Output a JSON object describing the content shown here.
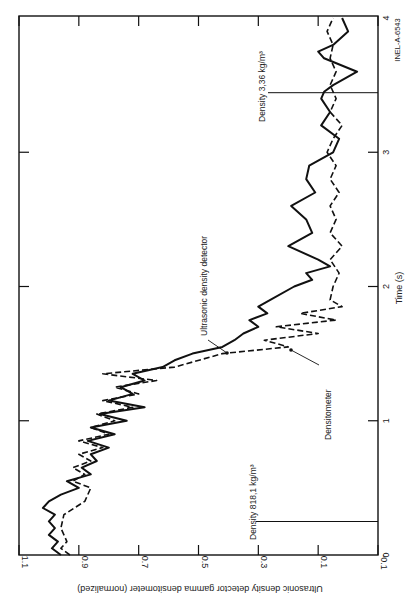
{
  "chart_data": {
    "type": "line",
    "orientation": "rotated 90 degrees clockwise (time axis vertical on right, value axis along bottom reading upside-down)",
    "title": "",
    "xlabel": "Time (s)",
    "ylabel": "Ultrasonic density detector gamma densitometer (normalized)",
    "xlim": [
      0,
      4
    ],
    "ylim": [
      -0.1,
      1.1
    ],
    "x_ticks": [
      "0",
      "1",
      "2",
      "3",
      "4"
    ],
    "y_ticks": [
      "1.1",
      "0.9",
      "0.7",
      "0.5",
      "0.3",
      "0.1",
      "-0.1"
    ],
    "grid": false,
    "legend": "inline annotations with leader arrows",
    "series": [
      {
        "name": "Ultrasonic density detector",
        "style": "solid",
        "points": [
          [
            0.0,
            0.96
          ],
          [
            0.05,
            0.99
          ],
          [
            0.1,
            0.97
          ],
          [
            0.15,
            1.0
          ],
          [
            0.2,
            0.98
          ],
          [
            0.25,
            1.0
          ],
          [
            0.3,
            0.98
          ],
          [
            0.35,
            1.02
          ],
          [
            0.4,
            1.0
          ],
          [
            0.45,
            0.96
          ],
          [
            0.5,
            0.9
          ],
          [
            0.55,
            0.94
          ],
          [
            0.6,
            0.86
          ],
          [
            0.65,
            0.89
          ],
          [
            0.7,
            0.84
          ],
          [
            0.75,
            0.86
          ],
          [
            0.8,
            0.8
          ],
          [
            0.85,
            0.87
          ],
          [
            0.9,
            0.78
          ],
          [
            0.95,
            0.86
          ],
          [
            1.0,
            0.74
          ],
          [
            1.05,
            0.83
          ],
          [
            1.1,
            0.68
          ],
          [
            1.15,
            0.8
          ],
          [
            1.2,
            0.72
          ],
          [
            1.25,
            0.76
          ],
          [
            1.3,
            0.68
          ],
          [
            1.35,
            0.72
          ],
          [
            1.4,
            0.62
          ],
          [
            1.45,
            0.58
          ],
          [
            1.5,
            0.52
          ],
          [
            1.55,
            0.42
          ],
          [
            1.6,
            0.38
          ],
          [
            1.65,
            0.35
          ],
          [
            1.7,
            0.3
          ],
          [
            1.75,
            0.33
          ],
          [
            1.8,
            0.27
          ],
          [
            1.85,
            0.3
          ],
          [
            1.9,
            0.26
          ],
          [
            2.0,
            0.18
          ],
          [
            2.05,
            0.12
          ],
          [
            2.1,
            0.14
          ],
          [
            2.15,
            0.06
          ],
          [
            2.2,
            0.1
          ],
          [
            2.3,
            0.2
          ],
          [
            2.4,
            0.12
          ],
          [
            2.5,
            0.14
          ],
          [
            2.6,
            0.19
          ],
          [
            2.7,
            0.11
          ],
          [
            2.8,
            0.14
          ],
          [
            2.9,
            0.13
          ],
          [
            3.0,
            0.05
          ],
          [
            3.1,
            0.03
          ],
          [
            3.2,
            0.09
          ],
          [
            3.3,
            0.06
          ],
          [
            3.4,
            0.09
          ],
          [
            3.45,
            0.08
          ],
          [
            3.5,
            0.05
          ],
          [
            3.6,
            -0.03
          ],
          [
            3.7,
            0.08
          ],
          [
            3.75,
            0.1
          ],
          [
            3.8,
            0.05
          ],
          [
            3.9,
            0.0
          ],
          [
            4.0,
            0.02
          ]
        ]
      },
      {
        "name": "Densitometer",
        "style": "dashed",
        "points": [
          [
            0.0,
            0.93
          ],
          [
            0.05,
            0.96
          ],
          [
            0.1,
            0.94
          ],
          [
            0.2,
            0.96
          ],
          [
            0.3,
            0.95
          ],
          [
            0.4,
            0.88
          ],
          [
            0.5,
            0.86
          ],
          [
            0.55,
            0.92
          ],
          [
            0.6,
            0.88
          ],
          [
            0.65,
            0.92
          ],
          [
            0.7,
            0.86
          ],
          [
            0.75,
            0.9
          ],
          [
            0.8,
            0.82
          ],
          [
            0.85,
            0.9
          ],
          [
            0.9,
            0.8
          ],
          [
            0.95,
            0.86
          ],
          [
            1.0,
            0.78
          ],
          [
            1.05,
            0.84
          ],
          [
            1.1,
            0.72
          ],
          [
            1.15,
            0.82
          ],
          [
            1.2,
            0.7
          ],
          [
            1.25,
            0.78
          ],
          [
            1.3,
            0.64
          ],
          [
            1.35,
            0.82
          ],
          [
            1.4,
            0.58
          ],
          [
            1.5,
            0.42
          ],
          [
            1.55,
            0.2
          ],
          [
            1.6,
            0.28
          ],
          [
            1.65,
            0.1
          ],
          [
            1.7,
            0.24
          ],
          [
            1.75,
            0.04
          ],
          [
            1.8,
            0.16
          ],
          [
            1.85,
            0.02
          ],
          [
            1.9,
            0.06
          ],
          [
            2.0,
            0.05
          ],
          [
            2.1,
            0.03
          ],
          [
            2.2,
            0.06
          ],
          [
            2.3,
            0.02
          ],
          [
            2.4,
            0.06
          ],
          [
            2.5,
            0.04
          ],
          [
            2.6,
            0.06
          ],
          [
            2.7,
            0.03
          ],
          [
            2.8,
            0.06
          ],
          [
            2.9,
            0.04
          ],
          [
            3.0,
            0.07
          ],
          [
            3.1,
            0.05
          ],
          [
            3.2,
            0.02
          ],
          [
            3.3,
            0.06
          ],
          [
            3.4,
            0.04
          ],
          [
            3.5,
            0.06
          ],
          [
            3.6,
            0.04
          ],
          [
            3.7,
            0.06
          ],
          [
            3.8,
            0.05
          ],
          [
            3.9,
            0.07
          ],
          [
            4.0,
            0.05
          ]
        ]
      }
    ],
    "annotations": [
      {
        "text": "Density 818,1 kg/m³",
        "time": 0.25,
        "value_anchor": 0.3
      },
      {
        "text": "Density 3,36 kg/m³",
        "time": 3.45,
        "value_anchor": 0.35
      },
      {
        "text": "Ultrasonic density detector",
        "points_to_time": 1.55,
        "points_to_value": 0.45
      },
      {
        "text": "Densitometer",
        "points_to_time": 1.55,
        "points_to_value": 0.19
      }
    ],
    "figure_id": "INEL-A-6543"
  },
  "labels": {
    "xlabel": "Time (s)",
    "ylabel": "Ultrasonic density detector gamma densitometer (normalized)",
    "x_ticks": [
      "0",
      "1",
      "2",
      "3",
      "4"
    ],
    "y_ticks": [
      "1.1",
      "0.9",
      "0.7",
      "0.5",
      "0.3",
      "0.1",
      "-0.1"
    ],
    "ann_density_low": "Density 818,1 kg/m³",
    "ann_density_high": "Density 3,36 kg/m³",
    "ann_ultrasonic": "Ultrasonic density detector",
    "ann_densitometer": "Densitometer",
    "figure_id": "INEL-A-6543"
  }
}
